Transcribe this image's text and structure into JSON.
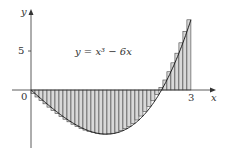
{
  "chart_data": {
    "type": "area",
    "title": "",
    "function": "y = x^3 - 6x",
    "equation_label": "y = x³ − 6x",
    "xlabel": "x",
    "ylabel": "y",
    "x_ticks": [
      {
        "value": 0,
        "label": "0"
      },
      {
        "value": 3,
        "label": "3"
      }
    ],
    "y_ticks": [
      {
        "value": 5,
        "label": "5"
      }
    ],
    "xlim": [
      0,
      3.4
    ],
    "ylim": [
      -6.2,
      11
    ],
    "riemann_sum": {
      "n": 40,
      "interval": [
        0,
        3
      ],
      "sample": "right endpoints",
      "fill": "#d9d9d9"
    },
    "grid": false,
    "legend": "none"
  },
  "labels": {
    "y_axis": "y",
    "x_axis": "x",
    "origin": "0",
    "tick_5": "5",
    "tick_3": "3",
    "equation": "y = x³ − 6x"
  }
}
